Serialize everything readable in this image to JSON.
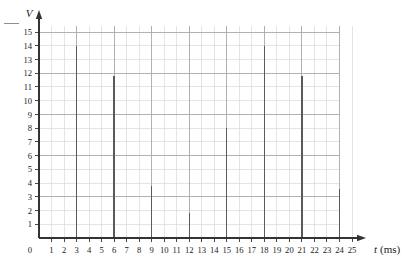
{
  "figure": {
    "lead_dash": "—",
    "background_color": "#ffffff"
  },
  "chart_data": {
    "type": "bar",
    "title": "",
    "subtitle": "",
    "xlabel": "t (ms)",
    "ylabel": "V",
    "x_axis_symbol": "t",
    "x_axis_unit": "(ms)",
    "y_axis_symbol": "V",
    "y_axis_unit": "",
    "xlim": [
      0,
      25
    ],
    "ylim": [
      0,
      15
    ],
    "grid": true,
    "legend": "none",
    "categories": [
      3,
      6,
      9,
      12,
      15,
      18,
      21,
      24
    ],
    "values": [
      14,
      11.8,
      3.8,
      1.8,
      8,
      14,
      11.8,
      3.6
    ],
    "x_tick_labels": [
      "0",
      "1",
      "2",
      "3",
      "4",
      "5",
      "6",
      "7",
      "8",
      "9",
      "10",
      "11",
      "12",
      "13",
      "14",
      "15",
      "16",
      "17",
      "18",
      "19",
      "20",
      "21",
      "22",
      "23",
      "24",
      "25"
    ],
    "y_tick_labels": [
      "1",
      "2",
      "3",
      "4",
      "5",
      "6",
      "7",
      "8",
      "9",
      "10",
      "11",
      "12",
      "13",
      "14",
      "15"
    ],
    "bar_color": "#5a5a5a",
    "grid_color_minor": "#d9d9d9",
    "grid_color_major": "#a8a8a8",
    "axis_color": "#333333",
    "bar_style": "impulse"
  }
}
